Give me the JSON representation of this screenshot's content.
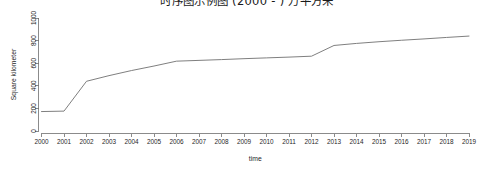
{
  "title": "时序图示例图 (2000 - ) 万平方米",
  "chart_data": {
    "type": "line",
    "title": "时序图示例图 (2000 - ) 万平方米",
    "xlabel": "time",
    "ylabel": "Square kilometer",
    "grid": false,
    "legend": "none",
    "xlim": [
      2000,
      2019
    ],
    "ylim": [
      0,
      1000
    ],
    "yticks": [
      0,
      200,
      400,
      600,
      800,
      1000
    ],
    "ytick_labels": [
      "0",
      "200",
      "400",
      "600",
      "800",
      "1000"
    ],
    "x": [
      2000,
      2001,
      2002,
      2003,
      2004,
      2005,
      2006,
      2007,
      2008,
      2009,
      2010,
      2011,
      2012,
      2013,
      2014,
      2015,
      2016,
      2017,
      2018,
      2019
    ],
    "xtick_labels": [
      "2000",
      "2001",
      "2002",
      "2003",
      "2004",
      "2005",
      "2006",
      "2007",
      "2008",
      "2009",
      "2010",
      "2011",
      "2012",
      "2013",
      "2014",
      "2015",
      "2016",
      "2017",
      "2018",
      "2019"
    ],
    "series": [
      {
        "name": "Square kilometer",
        "color": "#707070",
        "values": [
          172,
          176,
          440,
          490,
          535,
          575,
          618,
          625,
          632,
          640,
          647,
          654,
          662,
          757,
          775,
          790,
          803,
          815,
          828,
          840
        ]
      }
    ]
  }
}
